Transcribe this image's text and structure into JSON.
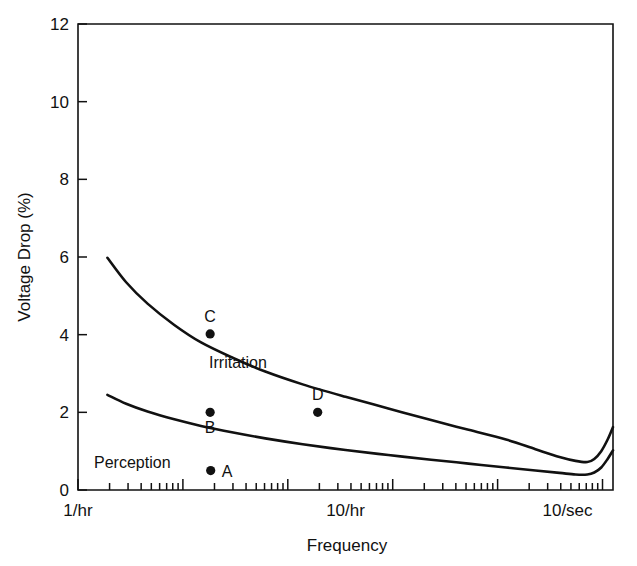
{
  "chart_data": {
    "type": "line",
    "title": "",
    "xlabel": "Frequency",
    "ylabel": "Voltage Drop (%)",
    "xscale": "log",
    "yscale": "linear",
    "ylim": [
      0,
      12
    ],
    "yticks": [
      0,
      2,
      4,
      6,
      8,
      10,
      12
    ],
    "ytick_labels": [
      "0",
      "2",
      "4",
      "6",
      "8",
      "10",
      "12"
    ],
    "xlim_labels": [
      "1/hr",
      "10/sec"
    ],
    "xtick_labels": [
      "1/hr",
      "10/hr",
      "10/sec"
    ],
    "xtick_label_positions": [
      0.0,
      0.5,
      0.915
    ],
    "grid": false,
    "legend": "inline-annotations",
    "series": [
      {
        "name": "Irritation",
        "label_position": {
          "x": 0.245,
          "y": 3.15
        },
        "points": [
          {
            "x": 0.055,
            "y": 5.98
          },
          {
            "x": 0.09,
            "y": 5.35
          },
          {
            "x": 0.13,
            "y": 4.8
          },
          {
            "x": 0.18,
            "y": 4.25
          },
          {
            "x": 0.23,
            "y": 3.8
          },
          {
            "x": 0.29,
            "y": 3.4
          },
          {
            "x": 0.35,
            "y": 3.05
          },
          {
            "x": 0.42,
            "y": 2.72
          },
          {
            "x": 0.5,
            "y": 2.4
          },
          {
            "x": 0.58,
            "y": 2.1
          },
          {
            "x": 0.66,
            "y": 1.8
          },
          {
            "x": 0.73,
            "y": 1.55
          },
          {
            "x": 0.8,
            "y": 1.3
          },
          {
            "x": 0.855,
            "y": 1.05
          },
          {
            "x": 0.9,
            "y": 0.85
          },
          {
            "x": 0.93,
            "y": 0.75
          },
          {
            "x": 0.952,
            "y": 0.72
          },
          {
            "x": 0.965,
            "y": 0.8
          },
          {
            "x": 0.978,
            "y": 1.0
          },
          {
            "x": 0.99,
            "y": 1.3
          },
          {
            "x": 1.0,
            "y": 1.62
          }
        ]
      },
      {
        "name": "Perception",
        "label_position": {
          "x": 0.03,
          "y": 0.56
        },
        "points": [
          {
            "x": 0.055,
            "y": 2.45
          },
          {
            "x": 0.09,
            "y": 2.22
          },
          {
            "x": 0.13,
            "y": 2.02
          },
          {
            "x": 0.18,
            "y": 1.82
          },
          {
            "x": 0.23,
            "y": 1.65
          },
          {
            "x": 0.29,
            "y": 1.48
          },
          {
            "x": 0.35,
            "y": 1.33
          },
          {
            "x": 0.42,
            "y": 1.18
          },
          {
            "x": 0.5,
            "y": 1.03
          },
          {
            "x": 0.58,
            "y": 0.9
          },
          {
            "x": 0.66,
            "y": 0.78
          },
          {
            "x": 0.73,
            "y": 0.68
          },
          {
            "x": 0.8,
            "y": 0.58
          },
          {
            "x": 0.855,
            "y": 0.5
          },
          {
            "x": 0.9,
            "y": 0.44
          },
          {
            "x": 0.93,
            "y": 0.4
          },
          {
            "x": 0.952,
            "y": 0.4
          },
          {
            "x": 0.965,
            "y": 0.45
          },
          {
            "x": 0.978,
            "y": 0.58
          },
          {
            "x": 0.99,
            "y": 0.8
          },
          {
            "x": 1.0,
            "y": 1.02
          }
        ]
      }
    ],
    "annotations": [
      {
        "label": "Irritation",
        "kind": "curve-name"
      },
      {
        "label": "Perception",
        "kind": "curve-name"
      }
    ],
    "data_points": [
      {
        "label": "A",
        "x": 0.248,
        "y": 0.5,
        "label_side": "right"
      },
      {
        "label": "B",
        "x": 0.247,
        "y": 2.0,
        "label_side": "below"
      },
      {
        "label": "C",
        "x": 0.247,
        "y": 4.02,
        "label_side": "above"
      },
      {
        "label": "D",
        "x": 0.448,
        "y": 2.0,
        "label_side": "above"
      }
    ]
  },
  "axes": {
    "y_title": "Voltage Drop (%)",
    "x_title": "Frequency",
    "y_ticks": [
      "0",
      "2",
      "4",
      "6",
      "8",
      "10",
      "12"
    ],
    "x_ticks": [
      "1/hr",
      "10/hr",
      "10/sec"
    ]
  },
  "labels": {
    "irritation": "Irritation",
    "perception": "Perception",
    "point_a": "A",
    "point_b": "B",
    "point_c": "C",
    "point_d": "D"
  },
  "colors": {
    "line": "#111111",
    "background": "#ffffff",
    "text": "#111111"
  }
}
